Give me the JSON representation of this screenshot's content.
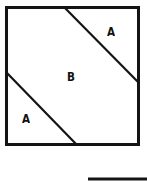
{
  "figure": {
    "type": "geometry-diagram",
    "stroke_color": "#141414",
    "fill_color": "#ffffff",
    "background_color": "#ffffff",
    "square": {
      "x": 5,
      "y": 6,
      "width": 135,
      "height": 140,
      "stroke_width": 3
    },
    "diagonals": [
      {
        "name": "upper-diagonal",
        "x1": 64,
        "y1": 6,
        "x2": 140,
        "y2": 83,
        "stroke_width": 2
      },
      {
        "name": "lower-diagonal",
        "x1": 5,
        "y1": 73,
        "x2": 77,
        "y2": 146,
        "stroke_width": 2
      }
    ],
    "labels": [
      {
        "name": "a-top-right",
        "text": "A",
        "x": 107,
        "y": 25
      },
      {
        "name": "b-middle",
        "text": "B",
        "x": 67,
        "y": 70
      },
      {
        "name": "a-bottom-left",
        "text": "A",
        "x": 22,
        "y": 112
      }
    ],
    "footer_rule": {
      "name": "bottom-rule",
      "x1": 88,
      "y1": 179,
      "x2": 147,
      "y2": 179,
      "stroke_width": 3
    }
  }
}
